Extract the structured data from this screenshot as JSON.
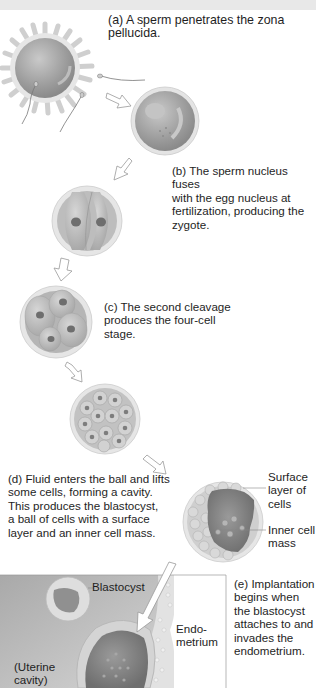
{
  "figure": {
    "type": "diagram",
    "stages": [
      {
        "id": "a",
        "caption": "(a) A sperm penetrates the zona pellucida."
      },
      {
        "id": "b",
        "caption_lines": [
          "(b) The sperm nucleus fuses",
          "with the egg nucleus at",
          "fertilization, producing the",
          "zygote."
        ]
      },
      {
        "id": "c",
        "caption_lines": [
          "(c) The second cleavage",
          "produces the four-cell",
          "stage."
        ]
      },
      {
        "id": "d",
        "caption_lines": [
          "(d) Fluid enters the ball and lifts",
          "some cells, forming a cavity.",
          "This produces the blastocyst,",
          "a ball of cells with a surface",
          "layer and an inner cell mass."
        ]
      },
      {
        "id": "e",
        "caption_lines": [
          "(e) Implantation",
          "begins when",
          "the blastocyst",
          "attaches to and",
          "invades the",
          "endometrium."
        ]
      }
    ],
    "labels": {
      "surface_layer": [
        "Surface",
        "layer of",
        "cells"
      ],
      "inner_cell_mass": [
        "Inner cell",
        "mass"
      ],
      "blastocyst": "Blastocyst",
      "endometrium": [
        "Endo-",
        "metrium"
      ],
      "uterine_cavity": [
        "(Uterine",
        "cavity)"
      ]
    },
    "colors": {
      "cell_fill": "#a9a9a9",
      "cell_light": "#d4d4d4",
      "zona": "#e4e4e4",
      "uterine_bg": "#bdbdbd",
      "cavity_dark": "#7f7f7f"
    }
  }
}
